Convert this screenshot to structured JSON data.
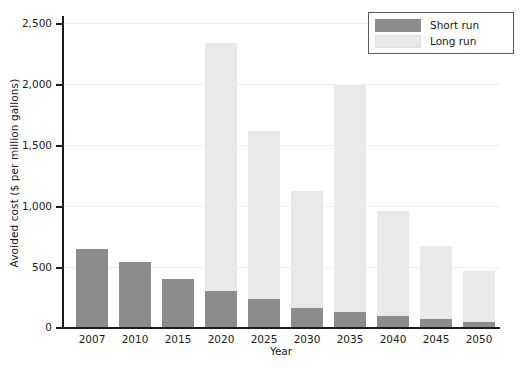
{
  "chart_data": {
    "type": "bar",
    "stacked": true,
    "title": "",
    "xlabel": "Year",
    "ylabel": "Avoided cost ($ per million gallons)",
    "categories": [
      "2007",
      "2010",
      "2015",
      "2020",
      "2025",
      "2030",
      "2035",
      "2040",
      "2045",
      "2050"
    ],
    "series": [
      {
        "name": "Short run",
        "color": "#8c8c8c",
        "values": [
          640,
          540,
          400,
          300,
          230,
          160,
          125,
          90,
          70,
          45
        ]
      },
      {
        "name": "Long run",
        "color": "#e9e9e9",
        "values": [
          0,
          0,
          0,
          2040,
          1390,
          960,
          1875,
          870,
          600,
          415
        ]
      }
    ],
    "totals": [
      640,
      540,
      400,
      2340,
      1620,
      1120,
      2000,
      960,
      670,
      460
    ],
    "ylim": [
      0,
      2500
    ],
    "yticks": [
      0,
      500,
      1000,
      1500,
      2000,
      2500
    ],
    "ytick_labels": [
      "0",
      "500",
      "1,000",
      "1,500",
      "2,000",
      "2,500"
    ],
    "grid": false,
    "legend_position": "top-right"
  },
  "legend": {
    "entries": [
      {
        "label": "Short run",
        "color": "#8c8c8c"
      },
      {
        "label": "Long run",
        "color": "#e9e9e9"
      }
    ]
  }
}
